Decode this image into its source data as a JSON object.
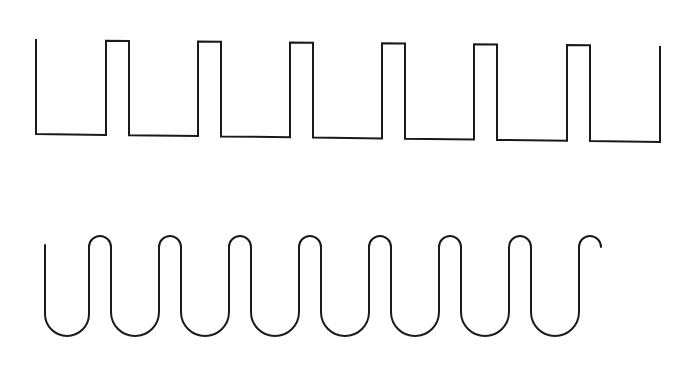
{
  "diagram": {
    "stroke_color": "#1a1a1a",
    "background_color": "#ffffff",
    "square_wave": {
      "label": "rectangular pulse train",
      "start": [
        36,
        39
      ],
      "low_level_y_start": 134,
      "low_level_y_end": 142,
      "high_level_y_start": 40,
      "high_level_y_end": 46,
      "pulses": [
        {
          "rise_x": 106,
          "fall_x": 129
        },
        {
          "rise_x": 198,
          "fall_x": 221
        },
        {
          "rise_x": 290,
          "fall_x": 313
        },
        {
          "rise_x": 382,
          "fall_x": 405
        },
        {
          "rise_x": 474,
          "fall_x": 497
        },
        {
          "rise_x": 567,
          "fall_x": 590
        }
      ],
      "end": [
        660,
        46
      ]
    },
    "rounded_wave": {
      "label": "rounded meander wave",
      "start": [
        45,
        245
      ],
      "top_y": 236,
      "bottom_y": 336,
      "crest_centers_x": [
        100,
        170,
        240,
        310,
        380,
        450,
        520,
        590
      ],
      "crest_width": 22,
      "end": [
        657,
        241
      ]
    }
  }
}
